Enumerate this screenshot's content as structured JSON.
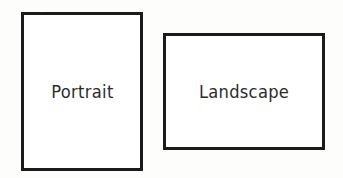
{
  "page": {
    "background_color": "#fdfdfc",
    "width": 343,
    "height": 178
  },
  "shapes": [
    {
      "id": "portrait",
      "label": "Portrait",
      "orientation": "portrait",
      "fill_color": "#ffffff",
      "stroke_color": "#1b1b1b",
      "stroke_width": 3,
      "x": 21,
      "y": 12,
      "width": 122,
      "height": 159
    },
    {
      "id": "landscape",
      "label": "Landscape",
      "orientation": "landscape",
      "fill_color": "#ffffff",
      "stroke_color": "#1b1b1b",
      "stroke_width": 3,
      "x": 163,
      "y": 33,
      "width": 162,
      "height": 117
    }
  ],
  "text_style": {
    "color": "#2b2b2b",
    "font_size": "17px"
  }
}
